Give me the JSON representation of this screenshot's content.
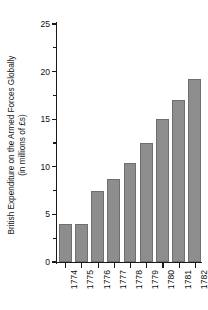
{
  "chart_data": {
    "type": "bar",
    "title": "",
    "xlabel": "",
    "ylabel_lines": [
      "British Expenditure on the Armed Forces Globally",
      "(in millions of £s)"
    ],
    "ylabel": "British Expenditure on the Armed Forces Globally (in millions of £s)",
    "categories": [
      "1774",
      "1775",
      "1776",
      "1777",
      "1778",
      "1779",
      "1780",
      "1781",
      "1782"
    ],
    "values": [
      4.0,
      4.0,
      7.5,
      8.7,
      10.4,
      12.5,
      15.0,
      17.0,
      19.2
    ],
    "ylim": [
      0,
      25
    ],
    "ytick_labels": [
      "0",
      "5",
      "10",
      "15",
      "20",
      "25"
    ],
    "ytick_values": [
      0,
      5,
      10,
      15,
      20,
      25
    ],
    "yminor_values": [
      2.5,
      7.5,
      12.5,
      17.5,
      22.5
    ],
    "grid": false,
    "legend": null,
    "bar_color": "#8d8d8d",
    "bar_edge_color": "#6f6f6f",
    "axis_color": "#1a1a1a",
    "background_color": "#ffffff"
  }
}
